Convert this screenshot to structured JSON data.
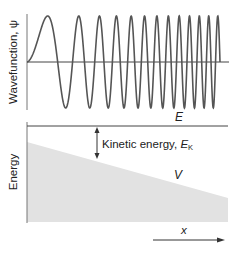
{
  "top_panel": {
    "ylabel": "Wavefunction, ψ",
    "wave": {
      "description": "oscillation whose wavelength decreases with increasing x",
      "cycles_visible": 12.5,
      "color": "#555555"
    }
  },
  "bottom_panel": {
    "ylabel": "Energy",
    "total_energy_label": "E",
    "kinetic_energy_label": "Kinetic energy, ",
    "kinetic_energy_symbol": "E",
    "kinetic_energy_subscript": "K",
    "potential_label": "V",
    "potential_fill_color": "#e2e2e2",
    "x_axis_label": "x"
  },
  "colors": {
    "line": "#444444",
    "axis": "#555555"
  }
}
